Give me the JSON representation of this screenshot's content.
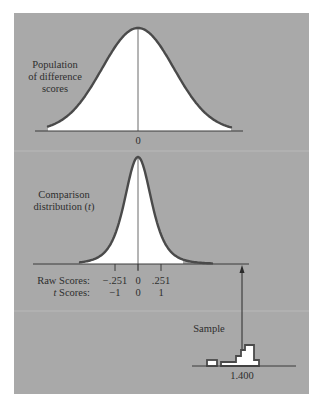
{
  "colors": {
    "panel": "#a9a9a9",
    "curve": "#4a4a4a",
    "fill": "#ffffff",
    "text": "#2e2e2e",
    "background": "#ffffff"
  },
  "population": {
    "label_lines": [
      "Population",
      "of difference",
      "scores"
    ],
    "center_label": "0"
  },
  "comparison": {
    "label_line1": "Comparison",
    "label_line2_prefix": "distribution (",
    "label_line2_symbol": "t",
    "label_line2_suffix": ")",
    "raw_scores_label": "Raw Scores:",
    "t_scores_label_symbol": "t",
    "t_scores_label_suffix": " Scores:",
    "raw_scores": [
      "−.251",
      "0",
      ".251"
    ],
    "t_scores": [
      "−1",
      "0",
      "1"
    ]
  },
  "sample": {
    "label": "Sample",
    "mean_label": "1.400"
  },
  "chart_data": {
    "type": "diagram",
    "title": "",
    "panels": [
      {
        "name": "Population of difference scores",
        "shape": "normal curve (wide)",
        "center": 0,
        "tick_labels": [
          "0"
        ]
      },
      {
        "name": "Comparison distribution (t)",
        "shape": "t distribution (narrow)",
        "raw_scores": [
          -0.251,
          0,
          0.251
        ],
        "t_scores": [
          -1,
          0,
          1
        ]
      },
      {
        "name": "Sample",
        "shape": "histogram",
        "mean": 1.4,
        "bars_relative_heights": [
          0.35,
          0.2,
          0.5,
          0.75,
          1.0,
          0.3
        ]
      }
    ],
    "annotations": [
      "Arrow from sample mean 1.400 up to comparison distribution axis"
    ]
  }
}
